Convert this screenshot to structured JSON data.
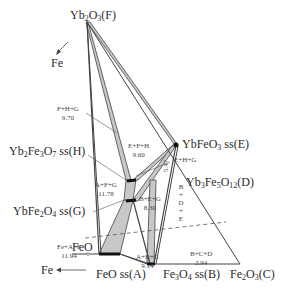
{
  "diagram": {
    "colors": {
      "line": "#444444",
      "band_fill": "#c8c8c8",
      "phase_marker": "#111111",
      "dashed": "#555555"
    },
    "vertices": {
      "top": {
        "formula": "Yb",
        "sub1": "2",
        "mid": "O",
        "sub2": "3",
        "tag": "(F)"
      },
      "left_arrow": "Fe",
      "feo_corner": "FeO",
      "bottom_left_arrow": "Fe",
      "bottom_right": {
        "formula": "Fe",
        "sub1": "2",
        "mid": "O",
        "sub2": "3",
        "tag": "(C)"
      }
    },
    "phases": {
      "A": {
        "label": "FeO ss",
        "tag": "(A)"
      },
      "B": {
        "formula": "Fe",
        "sub1": "3",
        "mid": "O",
        "sub2": "4",
        "suffix": " ss",
        "tag": "(B)"
      },
      "D": {
        "formula": "Yb",
        "sub1": "3",
        "mid": "Fe",
        "sub2": "5",
        "mid2": "O",
        "sub3": "12",
        "tag": "(D)"
      },
      "E": {
        "formula": "YbFeO",
        "sub1": "3",
        "suffix": " ss",
        "tag": "(E)"
      },
      "G": {
        "formula": "YbFe",
        "sub1": "2",
        "mid": "O",
        "sub2": "4",
        "suffix": " ss",
        "tag": "(G)"
      },
      "H": {
        "formula": "Yb",
        "sub1": "2",
        "mid": "Fe",
        "sub2": "3",
        "mid2": "O",
        "sub3": "7",
        "suffix": " ss",
        "tag": "(H)"
      }
    },
    "regions": [
      {
        "phases": "F+H+G",
        "value": "9.70"
      },
      {
        "phases": "E+F+H",
        "value": "9.60"
      },
      {
        "phases": "E+H+G",
        "value": ""
      },
      {
        "phases": "A+F+G",
        "value": "11.78"
      },
      {
        "phases": "B+E+G",
        "value": "8.30"
      },
      {
        "phases": "Fe+A+F",
        "value": "11.94"
      },
      {
        "phases": "A+B+G",
        "value": "9.14"
      },
      {
        "phases": "B+C+D",
        "value": "2.94"
      },
      {
        "phases": "B+D+E",
        "value": ""
      },
      {
        "phases": "",
        "value": "5.47"
      }
    ]
  }
}
